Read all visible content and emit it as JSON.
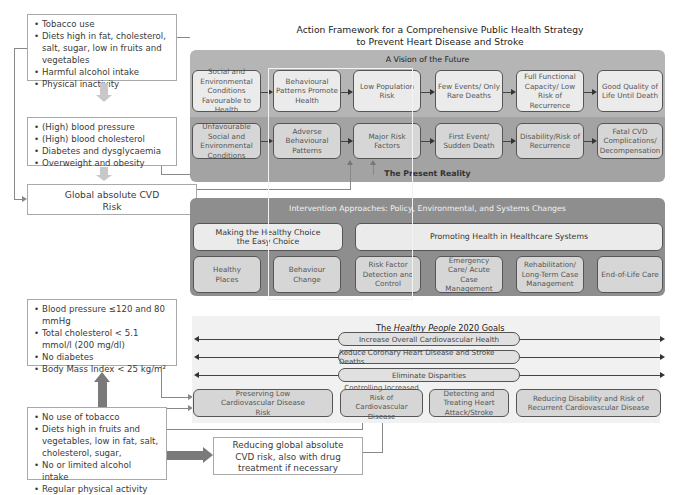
{
  "title": {
    "line1": "Action Framework for a Comprehensive Public Health Strategy",
    "line2": "to Prevent Heart Disease and Stroke"
  },
  "left_top": {
    "risk_behaviours": [
      "Tobacco use",
      "Diets high in fat, cholesterol, salt, sugar, low in fruits and vegetables",
      "Harmful alcohol intake",
      "Physical inactivity"
    ],
    "risk_factors": [
      "(High) blood pressure",
      "(High) blood cholesterol",
      "Diabetes and dysglycaemia",
      "Overweight and obesity"
    ],
    "global_risk": "Global absolute CVD Risk"
  },
  "vision": {
    "header": "A Vision of the Future",
    "nodes": [
      "Social and Environmental Conditions Favourable to Health",
      "Behavioural Patterns Promote Health",
      "Low Population Risk",
      "Few Events/ Only Rare Deaths",
      "Full Functional Capacity/ Low Risk of Recurrence",
      "Good Quality of Life Until Death"
    ]
  },
  "reality": {
    "footer": "The Present Reality",
    "nodes": [
      "Unfavourable Social and Environmental Conditions",
      "Adverse Behavioural Patterns",
      "Major Risk Factors",
      "First Event/ Sudden Death",
      "Disability/Risk of Recurrence",
      "Fatal CVD Complications/ Decompensation"
    ]
  },
  "interventions": {
    "header": "Intervention Approaches: Policy, Environmental, and Systems Changes",
    "group1": "Making the Healthy Choice the Easy Choice",
    "group2": "Promoting Health in Healthcare Systems",
    "items": [
      "Healthy Places",
      "Behaviour Change",
      "Risk Factor Detection and Control",
      "Emergency Care/ Acute Case Management",
      "Rehabilitation/ Long-Term Case Management",
      "End-of-Life Care"
    ]
  },
  "left_bottom": {
    "targets": [
      "Blood pressure ≤120 and 80 mmHg",
      "Total cholesterol < 5.1 mmol/l (200 mg/dl)",
      "No diabetes",
      "Body Mass Index < 25 kg/m²"
    ],
    "healthy_behaviours": [
      "No use of tobacco",
      "Diets high in fruits and vegetables, low in fat, salt, cholesterol, sugar,",
      "No or limited alcohol intake",
      "Regular physical activity"
    ],
    "reducing": "Reducing global absolute CVD risk, also with drug treatment if necessary"
  },
  "goals": {
    "header_pre": "The ",
    "header_italic": "Healthy People",
    "header_post": " 2020 Goals",
    "bars": [
      "Increase Overall Cardiovascular Health",
      "Reduce Coronary Heart Disease and Stroke Deaths",
      "Eliminate Disparities"
    ],
    "boxes": [
      "Preserving Low Cardiovascular Disease Risk",
      "Controlling Increased Risk of Cardiovascular Disease",
      "Detecting and Treating Heart Attack/Stroke",
      "Reducing Disability and Risk of Recurrent Cardiovascular Disease"
    ]
  }
}
